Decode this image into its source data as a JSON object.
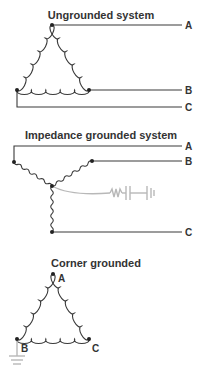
{
  "diagrams": [
    {
      "title": "Ungrounded system",
      "type": "delta",
      "phases": [
        "A",
        "B",
        "C"
      ]
    },
    {
      "title": "Impedance grounded system",
      "type": "wye",
      "phases": [
        "A",
        "B",
        "C"
      ],
      "grounding": "impedance (resistor-capacitor) to ground"
    },
    {
      "title": "Corner grounded",
      "type": "delta",
      "corners": [
        "A",
        "B",
        "C"
      ],
      "grounded_corner": "B"
    }
  ],
  "colors": {
    "line": "#3a3a3a",
    "ground_path": "#b8b8b8",
    "text": "#333333"
  }
}
